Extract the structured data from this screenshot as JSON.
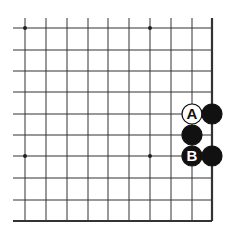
{
  "board": {
    "type": "go-board-corner",
    "x_lines": [
      25,
      46,
      67,
      88,
      108,
      129,
      150,
      171,
      192,
      212
    ],
    "y_lines": [
      28,
      50,
      71,
      92,
      114,
      135,
      156,
      178,
      200,
      221
    ],
    "line_start_x": 13,
    "line_start_y": 18,
    "right_edge_x": 212,
    "bottom_edge_y": 221,
    "star_points": [
      [
        25,
        28
      ],
      [
        150,
        28
      ],
      [
        25,
        156
      ],
      [
        150,
        156
      ]
    ],
    "stones": [
      {
        "color": "white",
        "x": 192,
        "y": 114,
        "label": "A"
      },
      {
        "color": "black",
        "x": 212,
        "y": 114,
        "label": ""
      },
      {
        "color": "black",
        "x": 192,
        "y": 135,
        "label": ""
      },
      {
        "color": "black",
        "x": 192,
        "y": 156,
        "label": "B"
      },
      {
        "color": "black",
        "x": 212,
        "y": 156,
        "label": ""
      }
    ],
    "colors": {
      "line": "#333333",
      "black_stone": "#111111",
      "white_stone": "#ffffff"
    }
  },
  "labels": {
    "a": "A",
    "b": "B"
  }
}
